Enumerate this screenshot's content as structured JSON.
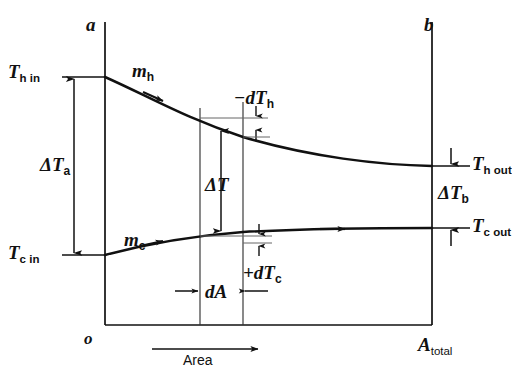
{
  "figure": {
    "kind": "heat-exchanger-temperature-area-diagram",
    "axes": {
      "origin_label": "o",
      "left_boundary_label": "a",
      "right_boundary_label": "b",
      "x_axis_label": "Area",
      "x_axis_end_label": "A",
      "x_axis_end_sub": "total"
    },
    "streams": {
      "hot": {
        "label": "m",
        "sub": "h"
      },
      "cold": {
        "label": "m",
        "sub": "c"
      }
    },
    "temperatures": {
      "hot_in": {
        "sym": "T",
        "sub": "h in"
      },
      "hot_out": {
        "sym": "T",
        "sub": "h out"
      },
      "cold_in": {
        "sym": "T",
        "sub": "c in"
      },
      "cold_out": {
        "sym": "T",
        "sub": "c out"
      }
    },
    "deltas": {
      "delta_a": {
        "sym": "ΔT",
        "sub": "a"
      },
      "delta_b": {
        "sym": "ΔT",
        "sub": "b"
      },
      "delta_mid": {
        "sym": "ΔT",
        "sub": ""
      },
      "d_hot": {
        "sym": "−dT",
        "sub": "h"
      },
      "d_cold": {
        "sym": "+dT",
        "sub": "c"
      },
      "d_area": {
        "sym": "dA",
        "sub": ""
      }
    },
    "colors": {
      "ink": "#111111",
      "background": "#ffffff",
      "thin_rule": "#555555"
    }
  }
}
